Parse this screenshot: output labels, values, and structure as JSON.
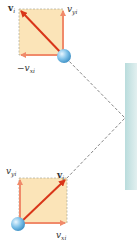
{
  "figure": {
    "colors": {
      "box_fill": "#fbe4b8",
      "box_border": "#9a9a8a",
      "component_arrow": "#f08a6a",
      "resultant_arrow": "#d9361a",
      "ball": "#7cc0e8",
      "wall": "#cfe6e6",
      "path": "#666666"
    }
  },
  "upper_ball": {
    "resultant_label": "v",
    "resultant_sub": "i",
    "y_component_label": "v",
    "y_component_sub": "yi",
    "x_component_prefix": "−v",
    "x_component_sub": "xi"
  },
  "lower_ball": {
    "resultant_label": "v",
    "resultant_sub": "i",
    "y_component_label": "v",
    "y_component_sub": "yi",
    "x_component_label": "v",
    "x_component_sub": "xi"
  },
  "wall": {
    "label": ""
  }
}
